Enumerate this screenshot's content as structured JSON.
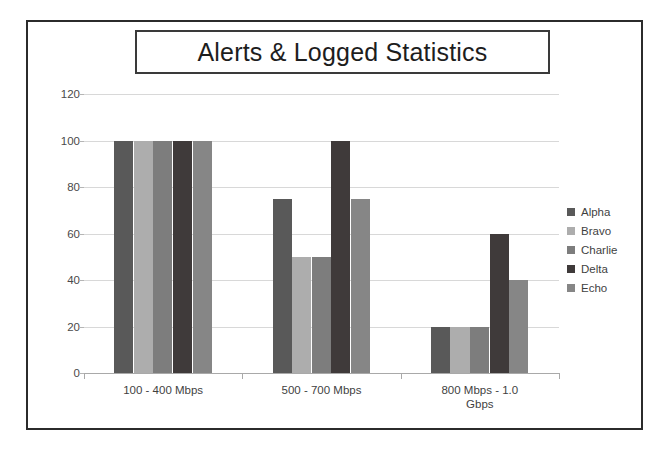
{
  "chart_data": {
    "type": "bar",
    "title": "Alerts & Logged Statistics",
    "xlabel": "",
    "ylabel": "",
    "ylim": [
      0,
      120
    ],
    "yticks": [
      0,
      20,
      40,
      60,
      80,
      100,
      120
    ],
    "ytick_labels": [
      "0",
      "20",
      "40",
      "60",
      "80",
      "100",
      "120"
    ],
    "grid": true,
    "legend_position": "right",
    "categories": [
      "100  - 400 Mbps",
      "500 - 700 Mbps",
      "800 Mbps - 1.0 Gbps"
    ],
    "category_lines": [
      [
        "100  - 400 Mbps"
      ],
      [
        "500 - 700 Mbps"
      ],
      [
        "800 Mbps - 1.0",
        "Gbps"
      ]
    ],
    "series": [
      {
        "name": "Alpha",
        "color": "#595959",
        "values": [
          100,
          75,
          20
        ]
      },
      {
        "name": "Bravo",
        "color": "#adadad",
        "values": [
          100,
          50,
          20
        ]
      },
      {
        "name": "Charlie",
        "color": "#7d7d7d",
        "values": [
          100,
          50,
          20
        ]
      },
      {
        "name": "Delta",
        "color": "#3f3a3a",
        "values": [
          100,
          100,
          60
        ]
      },
      {
        "name": "Echo",
        "color": "#868686",
        "values": [
          100,
          75,
          40
        ]
      }
    ]
  },
  "colors": {
    "frame_border": "#2b2b2b",
    "title_border": "#3a3a3a",
    "gridline": "#d8d8d8",
    "axis": "#a9a9a9",
    "tick_text": "#4a4a4a",
    "background": "#ffffff"
  }
}
